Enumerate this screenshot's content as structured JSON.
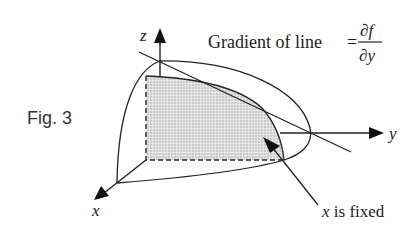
{
  "figure": {
    "label": "Fig. 3",
    "axes": {
      "x": "x",
      "y": "y",
      "z": "z"
    },
    "equation": {
      "text": "Gradient of line",
      "equals": "=",
      "numerator": "∂f",
      "denominator": "∂y"
    },
    "annotation": "x is fixed",
    "colors": {
      "line": "#222222",
      "shade": "#d8d8d8"
    }
  }
}
